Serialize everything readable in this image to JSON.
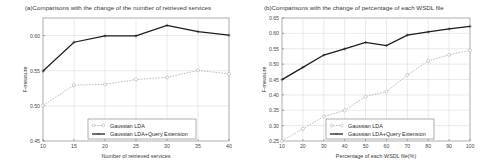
{
  "figure": {
    "background": "#ffffff",
    "accent_solid": "#1c1c1c",
    "accent_dotted": "#b4b4b4"
  },
  "panels": [
    {
      "key": "panel-a",
      "title": "(a)Comparisons with the change of the number of retrieved services",
      "chart_data": {
        "type": "line",
        "title": "(a)Comparisons with the change of the number of retrieved services",
        "xlabel": "Number of retrieved services",
        "ylabel": "F-measure",
        "x": [
          10,
          15,
          20,
          25,
          30,
          35,
          40
        ],
        "xticks": [
          "10",
          "15",
          "20",
          "25",
          "30",
          "35",
          "40"
        ],
        "yticks": [
          "0.45",
          "0.50",
          "0.55",
          "0.60"
        ],
        "xlim": [
          10,
          40
        ],
        "ylim": [
          0.45,
          0.625
        ],
        "grid": true,
        "legend_position": "lower center",
        "series": [
          {
            "name": "Gaussian LDA",
            "style": "dotted",
            "marker": "open-circle",
            "values": [
              0.5005,
              0.5295,
              0.5305,
              0.5375,
              0.5405,
              0.5505,
              0.5455
            ]
          },
          {
            "name": "Gaussian LDA+Query Extension",
            "style": "solid",
            "marker": "plus",
            "values": [
              0.5495,
              0.5905,
              0.5995,
              0.5995,
              0.6145,
              0.6055,
              0.6005
            ]
          }
        ]
      }
    },
    {
      "key": "panel-b",
      "title": "(b)Comparisons with the change of percentage of each WSDL file",
      "chart_data": {
        "type": "line",
        "title": "(b)Comparisons with the change of percentage of each WSDL file",
        "xlabel": "Percentage of each WSDL file(%)",
        "ylabel": "F-measure",
        "x": [
          10,
          20,
          30,
          40,
          50,
          60,
          70,
          80,
          90,
          100
        ],
        "xticks": [
          "10",
          "20",
          "30",
          "40",
          "50",
          "60",
          "70",
          "80",
          "90",
          "100"
        ],
        "yticks": [
          "0.25",
          "0.30",
          "0.35",
          "0.40",
          "0.45",
          "0.50",
          "0.55",
          "0.60",
          "0.65"
        ],
        "xlim": [
          10,
          100
        ],
        "ylim": [
          0.25,
          0.65
        ],
        "grid": true,
        "legend_position": "lower center",
        "series": [
          {
            "name": "Gaussian LDA",
            "style": "dotted",
            "marker": "open-circle",
            "values": [
              0.2505,
              0.2895,
              0.3295,
              0.3495,
              0.3945,
              0.4105,
              0.4645,
              0.5105,
              0.5305,
              0.5445
            ]
          },
          {
            "name": "Gaussian LDA+Query Extension",
            "style": "solid",
            "marker": "plus",
            "values": [
              0.4495,
              0.4895,
              0.5295,
              0.5495,
              0.5705,
              0.5605,
              0.5945,
              0.6045,
              0.6145,
              0.6225
            ]
          }
        ]
      }
    }
  ]
}
